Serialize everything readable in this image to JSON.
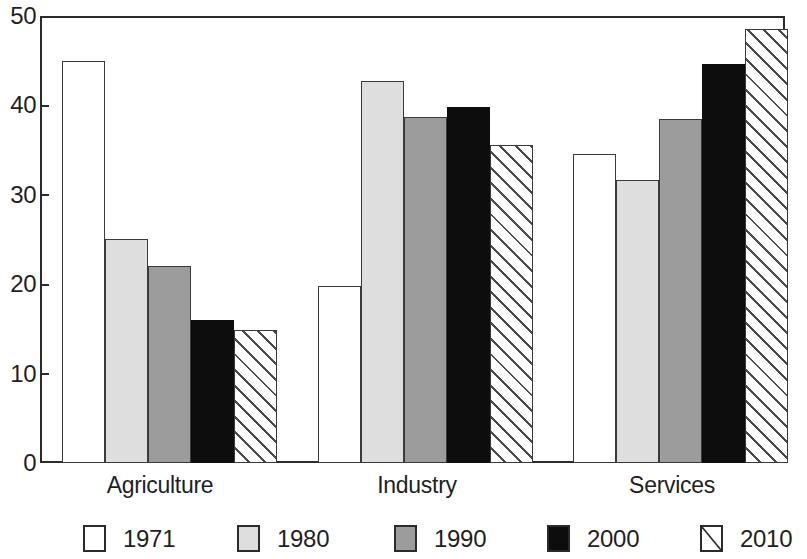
{
  "chart_data": {
    "type": "bar",
    "title": "",
    "subtitle": "",
    "xlabel": "",
    "ylabel": "",
    "ylim": [
      0,
      50
    ],
    "yticks": [
      0,
      10,
      20,
      30,
      40,
      50
    ],
    "ytick_labels": [
      "0",
      "10",
      "20",
      "30",
      "40",
      "50"
    ],
    "grid": false,
    "legend_position": "bottom",
    "categories": [
      "Agriculture",
      "Industry",
      "Services"
    ],
    "series": [
      {
        "name": "1971",
        "fill": "white",
        "color": "#ffffff",
        "values": [
          45.0,
          19.8,
          34.6
        ]
      },
      {
        "name": "1980",
        "fill": "light",
        "color": "#dedede",
        "values": [
          25.0,
          42.7,
          31.7
        ]
      },
      {
        "name": "1990",
        "fill": "mid",
        "color": "#9c9c9c",
        "values": [
          22.0,
          38.7,
          38.5
        ]
      },
      {
        "name": "2000",
        "fill": "black",
        "color": "#0d0d0d",
        "values": [
          16.0,
          39.8,
          44.6
        ]
      },
      {
        "name": "2010",
        "fill": "hatch",
        "color": "#ffffff",
        "values": [
          14.9,
          35.6,
          48.5
        ]
      }
    ]
  },
  "legend": {
    "entries": [
      {
        "label": "1971",
        "swatch": "white-square-swatch"
      },
      {
        "label": "1980",
        "swatch": "light-gray-square-swatch"
      },
      {
        "label": "1990",
        "swatch": "mid-gray-square-swatch"
      },
      {
        "label": "2000",
        "swatch": "black-square-swatch"
      },
      {
        "label": "2010",
        "swatch": "diagonal-hatch-square-swatch"
      }
    ]
  },
  "axis": {
    "y_tick_labels": [
      "50",
      "40",
      "30",
      "20",
      "10",
      "0"
    ],
    "x_category_labels": [
      "Agriculture",
      "Industry",
      "Services"
    ]
  }
}
